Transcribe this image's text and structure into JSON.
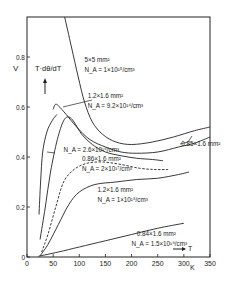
{
  "chart_data": {
    "type": "line",
    "title": "",
    "ylabel": "V",
    "ylabel_expr": "T·dθ/dT",
    "xlabel": "T",
    "xunit": "K",
    "xlim": [
      0,
      350
    ],
    "ylim": [
      0,
      0.96
    ],
    "xticks": [
      0,
      50,
      100,
      150,
      200,
      250,
      300,
      350
    ],
    "xtick_labels": [
      "0",
      "50",
      "100",
      "150",
      "200",
      "250",
      "300",
      "350"
    ],
    "yticks": [
      0,
      0.2,
      0.4,
      0.6,
      0.8
    ],
    "ytick_labels": [
      "0",
      "0.2",
      "0.4",
      "0.6",
      "0.8"
    ],
    "grid": false,
    "legend": "inline annotations",
    "series": [
      {
        "name": "5×5 mm², N_A = 1×10^15/cm³",
        "label_line1": "5×5 mm²",
        "label_line2": "N_A = 1×10¹⁵/cm³",
        "style": "solid",
        "points": [
          [
            72,
            0.96
          ],
          [
            85,
            0.84
          ],
          [
            98,
            0.72
          ],
          [
            110,
            0.62
          ],
          [
            125,
            0.54
          ],
          [
            145,
            0.49
          ],
          [
            170,
            0.46
          ],
          [
            200,
            0.45
          ],
          [
            240,
            0.46
          ],
          [
            280,
            0.48
          ],
          [
            320,
            0.505
          ],
          [
            350,
            0.52
          ]
        ]
      },
      {
        "name": "1.2×1.6 mm², N_A = 9.2×10^14/cm³",
        "label_line1": "1.2×1.6 mm²",
        "label_line2": "N_A = 9.2×10¹⁴/cm³",
        "style": "solid",
        "points": [
          [
            50,
            0.59
          ],
          [
            54,
            0.61
          ],
          [
            60,
            0.605
          ],
          [
            75,
            0.57
          ],
          [
            95,
            0.52
          ],
          [
            120,
            0.47
          ],
          [
            150,
            0.44
          ],
          [
            180,
            0.42
          ],
          [
            210,
            0.415
          ],
          [
            250,
            0.42
          ],
          [
            290,
            0.44
          ],
          [
            320,
            0.455
          ],
          [
            350,
            0.48
          ]
        ]
      },
      {
        "name": "0.85×1.6 mm²",
        "label_line1": "0.85×1.6 mm²",
        "style": "solid",
        "points": [
          [
            23,
            0.17
          ],
          [
            26,
            0.3
          ],
          [
            30,
            0.42
          ],
          [
            38,
            0.5
          ],
          [
            48,
            0.545
          ],
          [
            57,
            0.57
          ]
        ]
      },
      {
        "name": "N_A = 2.6×10^16/cm³",
        "label_line1": "N_A = 2.6×10¹⁶/cm³",
        "style": "solid",
        "points": [
          [
            25,
            0.07
          ],
          [
            35,
            0.2
          ],
          [
            45,
            0.34
          ],
          [
            58,
            0.47
          ],
          [
            70,
            0.545
          ],
          [
            80,
            0.56
          ],
          [
            90,
            0.54
          ],
          [
            105,
            0.49
          ],
          [
            125,
            0.45
          ],
          [
            150,
            0.42
          ],
          [
            180,
            0.405
          ],
          [
            210,
            0.395
          ],
          [
            240,
            0.39
          ],
          [
            260,
            0.385
          ]
        ]
      },
      {
        "name": "0.86×1.6 mm², N_A = 2×10^17/cm³",
        "label_line1": "0.86×1.6 mm²",
        "label_line2": "N_A = 2×10¹⁷/cm³",
        "style": "dashed-top",
        "points": [
          [
            28,
            0.02
          ],
          [
            40,
            0.09
          ],
          [
            55,
            0.2
          ],
          [
            70,
            0.3
          ],
          [
            90,
            0.35
          ],
          [
            115,
            0.375
          ],
          [
            145,
            0.38
          ],
          [
            180,
            0.37
          ],
          [
            215,
            0.355
          ],
          [
            245,
            0.35
          ],
          [
            270,
            0.35
          ]
        ]
      },
      {
        "name": "1.2×1.6 mm², N_A = 1×10^18/cm³",
        "label_line1": "1.2×1.6 mm²",
        "label_line2": "N_A = 1×10¹⁸/cm³",
        "style": "solid",
        "points": [
          [
            25,
            0.005
          ],
          [
            40,
            0.05
          ],
          [
            60,
            0.13
          ],
          [
            80,
            0.21
          ],
          [
            100,
            0.26
          ],
          [
            130,
            0.29
          ],
          [
            170,
            0.3
          ],
          [
            210,
            0.31
          ],
          [
            250,
            0.315
          ],
          [
            290,
            0.33
          ],
          [
            310,
            0.34
          ]
        ]
      },
      {
        "name": "0.84×1.6 mm², N_A = 1.5×10^19/cm³",
        "label_line1": "0.84×1.6 mm²",
        "label_line2": "N_A = 1.5×10¹⁹/cm³",
        "style": "solid",
        "points": [
          [
            22,
            0.003
          ],
          [
            60,
            0.02
          ],
          [
            100,
            0.04
          ],
          [
            150,
            0.065
          ],
          [
            200,
            0.09
          ],
          [
            250,
            0.115
          ],
          [
            300,
            0.135
          ]
        ]
      }
    ],
    "annotations": [
      {
        "text": "5×5 mm²",
        "x": 110,
        "y": 0.78
      },
      {
        "text": "N_A = 1×10¹⁵/cm³",
        "x": 110,
        "y": 0.74
      },
      {
        "text": "1.2×1.6 mm²",
        "x": 116,
        "y": 0.635
      },
      {
        "text": "N_A = 9.2×10¹⁴/cm³",
        "x": 116,
        "y": 0.595
      },
      {
        "text": "N_A = 2.6×10¹⁶/cm³",
        "x": 70,
        "y": 0.42
      },
      {
        "text": "0.85×1.6 mm²",
        "x": 295,
        "y": 0.445
      },
      {
        "text": "0.86×1.6 mm²",
        "x": 105,
        "y": 0.385
      },
      {
        "text": "N_A = 2×10¹⁷/cm³",
        "x": 105,
        "y": 0.345
      },
      {
        "text": "1.2×1.6 mm²",
        "x": 135,
        "y": 0.26
      },
      {
        "text": "N_A = 1×10¹⁸/cm³",
        "x": 135,
        "y": 0.22
      },
      {
        "text": "0.84×1.6 mm²",
        "x": 210,
        "y": 0.085
      },
      {
        "text": "N_A = 1.5×10¹⁹/cm³",
        "x": 200,
        "y": 0.045
      }
    ]
  },
  "axis": {
    "y_unit": "V",
    "y_expr": "T·dθ/dT",
    "x_var": "T",
    "x_unit": "K"
  }
}
